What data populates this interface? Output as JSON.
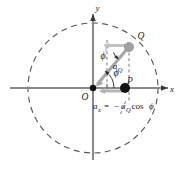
{
  "figure": {
    "axes": {
      "x_label": "x",
      "y_label": "y"
    },
    "points": [
      {
        "id": "O",
        "label": "O",
        "role": "origin",
        "x": 93,
        "y": 88,
        "style": "filled-black-small"
      },
      {
        "id": "P",
        "label": "P",
        "role": "projection-point",
        "x": 125,
        "y": 88,
        "style": "filled-black-large"
      },
      {
        "id": "Q",
        "label": "Q",
        "role": "circle-point",
        "x": 129,
        "y": 47,
        "style": "filled-gray"
      }
    ],
    "angles": [
      {
        "id": "phi-origin",
        "label": "ϕ",
        "at": "origin",
        "between": "x-axis and OQ radius"
      },
      {
        "id": "phi-at-Q",
        "label": "ϕ",
        "at": "Q",
        "between": "vertical dashed line and a_Q vector"
      }
    ],
    "vectors": [
      {
        "id": "a_Q",
        "label": "a",
        "sub": "Q",
        "from": "Q",
        "to": "O",
        "color": "#a8a8a8",
        "description": "centripetal acceleration of point Q directed toward center"
      },
      {
        "id": "a_x",
        "label": "a",
        "sub": "x",
        "from": "P",
        "to": "left",
        "color": "#a8a8a8",
        "description": "x-component of acceleration along the x axis"
      },
      {
        "id": "a_Q-component-at-Q",
        "from": "Q",
        "to": "left",
        "color": "#bdbdbd",
        "description": "horizontal component arrow drawn at Q"
      }
    ],
    "equation": {
      "lhs_var": "a",
      "lhs_sub": "x",
      "equals": "=",
      "rhs_sign": "−",
      "rhs_var": "a",
      "rhs_sub": "Q",
      "rhs_trig": "cos",
      "rhs_angle": "ϕ",
      "full_text": "a_x = −a_Q cos ϕ"
    },
    "circle": {
      "center_x": 93,
      "center_y": 88,
      "radius": 65,
      "stroke": "#555555",
      "dashed": true,
      "description": "reference circle (dashed)"
    },
    "colors": {
      "axis": "#8a8a8a",
      "circle": "#5a5a5a",
      "vector_gray": "#a8a8a8",
      "vector_light_gray": "#c2c2c2",
      "point_black": "#111111",
      "point_gray": "#a0a0a0",
      "text": "#1a1a1a",
      "background": "#ffffff"
    }
  }
}
